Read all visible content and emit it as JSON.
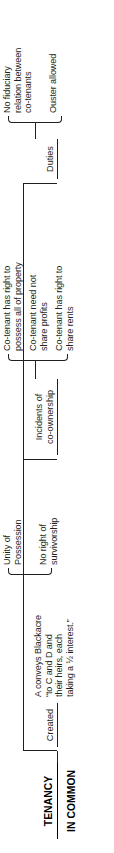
{
  "diagram": {
    "type": "tree-outline",
    "orientation": "rotated-90-ccw",
    "title": "TENANCY\nIN COMMON",
    "title_line1": "TENANCY",
    "title_line2": "IN COMMON",
    "accent_color": "#231f20",
    "background_color": "#ffffff",
    "branches": [
      {
        "id": "created",
        "label": "Created",
        "children": [
          {
            "id": "created-example",
            "text": "A conveys Blackacre\n“to C and D and\ntheir heirs, each\ntaking a ½ interest.”"
          }
        ]
      },
      {
        "id": "unity",
        "label": "",
        "children": [
          {
            "id": "unity-possession",
            "text": "Unity of\nPossession"
          },
          {
            "id": "no-survivorship",
            "text": "No right of\nsurvivorship"
          }
        ]
      },
      {
        "id": "incidents",
        "label": "Incidents of\nco-ownership",
        "children": [
          {
            "id": "incident-possess",
            "text": "Co-tenant has right to\npossess all of property"
          },
          {
            "id": "incident-profits",
            "text": "Co-tenant need not\nshare profits"
          },
          {
            "id": "incident-rents",
            "text": "Co-tenant has right to\nshare rents"
          }
        ]
      },
      {
        "id": "duties",
        "label": "Duties",
        "children": [
          {
            "id": "duty-no-fiduciary",
            "text": "No fiduciary\nrelation between\nco-tenants"
          },
          {
            "id": "duty-ouster",
            "text": "Ouster allowed"
          }
        ]
      }
    ]
  }
}
